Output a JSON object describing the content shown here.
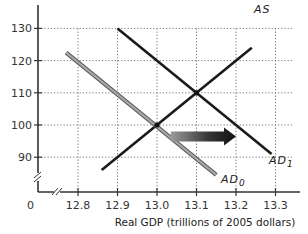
{
  "chart_data": {
    "type": "line",
    "title": "",
    "xlabel": "Real GDP (trillions of 2005 dollars)",
    "ylabel": "",
    "origin_label": "0",
    "xlim": [
      12.7,
      13.35
    ],
    "ylim": [
      80,
      135
    ],
    "x_ticks": [
      12.8,
      12.9,
      13.0,
      13.1,
      13.2,
      13.3
    ],
    "x_tick_labels": [
      "12.8",
      "12.9",
      "13.0",
      "13.1",
      "13.2",
      "13.3"
    ],
    "y_ticks": [
      90,
      100,
      110,
      120,
      130
    ],
    "y_tick_labels": [
      "90",
      "100",
      "110",
      "120",
      "130"
    ],
    "grid": true,
    "axis_breaks": true,
    "series": [
      {
        "name": "AS",
        "label": "AS",
        "color": "#1a1a1a",
        "points": [
          [
            12.86,
            86
          ],
          [
            13.24,
            124
          ]
        ]
      },
      {
        "name": "AD1",
        "label": "AD",
        "subscript": "1",
        "color": "#1a1a1a",
        "points": [
          [
            12.9,
            130
          ],
          [
            13.29,
            91
          ]
        ]
      },
      {
        "name": "AD0",
        "label": "AD",
        "subscript": "0",
        "color": "#8a8a8a",
        "points": [
          [
            12.77,
            122.5
          ],
          [
            13.15,
            84.5
          ]
        ]
      }
    ],
    "equilibria": [
      [
        13.0,
        100
      ],
      [
        13.1,
        110
      ]
    ],
    "annotations": [
      {
        "type": "arrow",
        "description": "shift of aggregate demand to the right",
        "from": [
          13.035,
          98
        ],
        "to": [
          13.2,
          98
        ]
      }
    ]
  }
}
